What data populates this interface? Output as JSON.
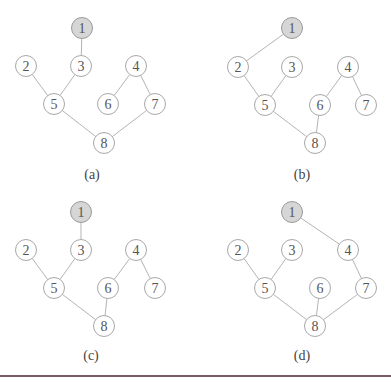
{
  "node_radius": 10.5,
  "colors": {
    "edge": "#b4b4b4",
    "node_stroke": "#a8a8a8",
    "node_fill": "#ffffff",
    "root_fill": "#d6d6d6",
    "label": "#555555",
    "rule": "#7a5a62"
  },
  "subfigures": [
    {
      "id": "a",
      "label": "(a)",
      "label_pos": [
        92,
        174
      ],
      "root": "1",
      "nodes": {
        "1": [
          82,
          28
        ],
        "2": [
          26,
          66
        ],
        "3": [
          81,
          66
        ],
        "4": [
          136,
          66
        ],
        "5": [
          54,
          104
        ],
        "6": [
          108,
          104
        ],
        "7": [
          155,
          104
        ],
        "8": [
          104,
          143
        ]
      },
      "edges": [
        [
          "1",
          "3"
        ],
        [
          "2",
          "5"
        ],
        [
          "3",
          "5"
        ],
        [
          "5",
          "8"
        ],
        [
          "4",
          "6"
        ],
        [
          "4",
          "7"
        ],
        [
          "7",
          "8"
        ]
      ]
    },
    {
      "id": "b",
      "label": "(b)",
      "label_pos": [
        302,
        174
      ],
      "root": "1",
      "nodes": {
        "1": [
          292,
          28
        ],
        "2": [
          238,
          67
        ],
        "3": [
          292,
          67
        ],
        "4": [
          348,
          67
        ],
        "5": [
          265,
          105
        ],
        "6": [
          320,
          105
        ],
        "7": [
          366,
          105
        ],
        "8": [
          315,
          143
        ]
      },
      "edges": [
        [
          "1",
          "2"
        ],
        [
          "2",
          "5"
        ],
        [
          "3",
          "5"
        ],
        [
          "5",
          "8"
        ],
        [
          "4",
          "6"
        ],
        [
          "4",
          "7"
        ],
        [
          "6",
          "8"
        ]
      ]
    },
    {
      "id": "c",
      "label": "(c)",
      "label_pos": [
        91,
        355
      ],
      "root": "1",
      "nodes": {
        "1": [
          81,
          212
        ],
        "2": [
          26,
          250
        ],
        "3": [
          81,
          250
        ],
        "4": [
          136,
          250
        ],
        "5": [
          54,
          288
        ],
        "6": [
          108,
          288
        ],
        "7": [
          155,
          288
        ],
        "8": [
          104,
          326
        ]
      },
      "edges": [
        [
          "1",
          "3"
        ],
        [
          "2",
          "5"
        ],
        [
          "3",
          "5"
        ],
        [
          "5",
          "8"
        ],
        [
          "4",
          "6"
        ],
        [
          "4",
          "7"
        ],
        [
          "6",
          "8"
        ]
      ]
    },
    {
      "id": "d",
      "label": "(d)",
      "label_pos": [
        302,
        355
      ],
      "root": "1",
      "nodes": {
        "1": [
          292,
          212
        ],
        "2": [
          238,
          250
        ],
        "3": [
          292,
          250
        ],
        "4": [
          348,
          250
        ],
        "5": [
          265,
          288
        ],
        "6": [
          320,
          288
        ],
        "7": [
          366,
          288
        ],
        "8": [
          315,
          326
        ]
      },
      "edges": [
        [
          "1",
          "4"
        ],
        [
          "2",
          "5"
        ],
        [
          "3",
          "5"
        ],
        [
          "5",
          "8"
        ],
        [
          "6",
          "8"
        ],
        [
          "4",
          "7"
        ],
        [
          "7",
          "8"
        ]
      ]
    }
  ]
}
